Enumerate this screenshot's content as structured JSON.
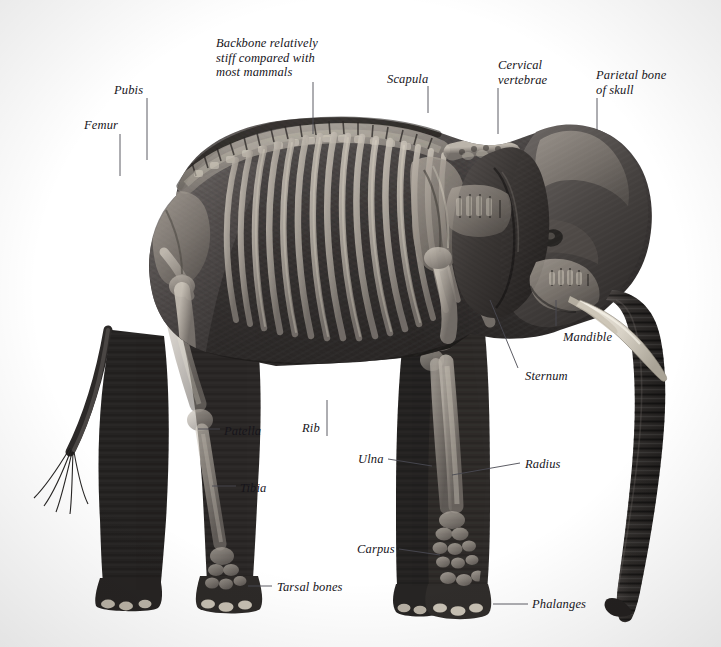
{
  "figure": {
    "view": "lateral, facing right",
    "background_color": "#ffffff",
    "label_color": "#16141a",
    "leader_color": "#4a4a52",
    "width": 721,
    "height": 647
  },
  "labels": [
    {
      "id": "femur",
      "text": "Femur",
      "x": 84,
      "y": 118,
      "align": "left",
      "leader": [
        [
          120,
          134
        ],
        [
          120,
          176
        ]
      ]
    },
    {
      "id": "pubis",
      "text": "Pubis",
      "x": 114,
      "y": 83,
      "align": "left",
      "leader": [
        [
          147,
          98
        ],
        [
          147,
          160
        ]
      ]
    },
    {
      "id": "backbone",
      "text": "Backbone relatively\nstiff compared with\nmost mammals",
      "x": 216,
      "y": 36,
      "align": "left",
      "leader": [
        [
          313,
          82
        ],
        [
          313,
          134
        ]
      ]
    },
    {
      "id": "scapula",
      "text": "Scapula",
      "x": 387,
      "y": 72,
      "align": "left",
      "leader": [
        [
          428,
          86
        ],
        [
          428,
          113
        ]
      ]
    },
    {
      "id": "cervical",
      "text": "Cervical\nvertebrae",
      "x": 498,
      "y": 58,
      "align": "left",
      "leader": [
        [
          498,
          88
        ],
        [
          498,
          134
        ]
      ]
    },
    {
      "id": "parietal",
      "text": "Parietal bone\nof skull",
      "x": 596,
      "y": 68,
      "align": "left",
      "leader": [
        [
          597,
          98
        ],
        [
          597,
          130
        ]
      ]
    },
    {
      "id": "mandible",
      "text": "Mandible",
      "x": 563,
      "y": 330,
      "align": "left",
      "leader": [
        [
          556,
          300
        ],
        [
          556,
          326
        ]
      ]
    },
    {
      "id": "sternum",
      "text": "Sternum",
      "x": 525,
      "y": 369,
      "align": "left",
      "leader": [
        [
          490,
          300
        ],
        [
          518,
          368
        ]
      ]
    },
    {
      "id": "patella",
      "text": "Patella",
      "x": 224,
      "y": 424,
      "align": "left",
      "leader": [
        [
          198,
          429
        ],
        [
          220,
          429
        ]
      ]
    },
    {
      "id": "rib",
      "text": "Rib",
      "x": 302,
      "y": 421,
      "align": "left",
      "leader": [
        [
          327,
          400
        ],
        [
          327,
          436
        ]
      ]
    },
    {
      "id": "tibia",
      "text": "Tibia",
      "x": 240,
      "y": 481,
      "align": "left",
      "leader": [
        [
          212,
          486
        ],
        [
          236,
          486
        ]
      ]
    },
    {
      "id": "ulna",
      "text": "Ulna",
      "x": 358,
      "y": 452,
      "align": "left",
      "leader": [
        [
          388,
          459
        ],
        [
          432,
          466
        ]
      ]
    },
    {
      "id": "radius",
      "text": "Radius",
      "x": 525,
      "y": 457,
      "align": "left",
      "leader": [
        [
          452,
          475
        ],
        [
          520,
          463
        ]
      ]
    },
    {
      "id": "carpus",
      "text": "Carpus",
      "x": 357,
      "y": 542,
      "align": "left",
      "leader": [
        [
          399,
          549
        ],
        [
          440,
          555
        ]
      ]
    },
    {
      "id": "tarsal",
      "text": "Tarsal bones",
      "x": 277,
      "y": 580,
      "align": "left",
      "leader": [
        [
          248,
          586
        ],
        [
          272,
          586
        ]
      ]
    },
    {
      "id": "phalanges",
      "text": "Phalanges",
      "x": 532,
      "y": 597,
      "align": "left",
      "leader": [
        [
          493,
          604
        ],
        [
          528,
          604
        ]
      ]
    }
  ]
}
